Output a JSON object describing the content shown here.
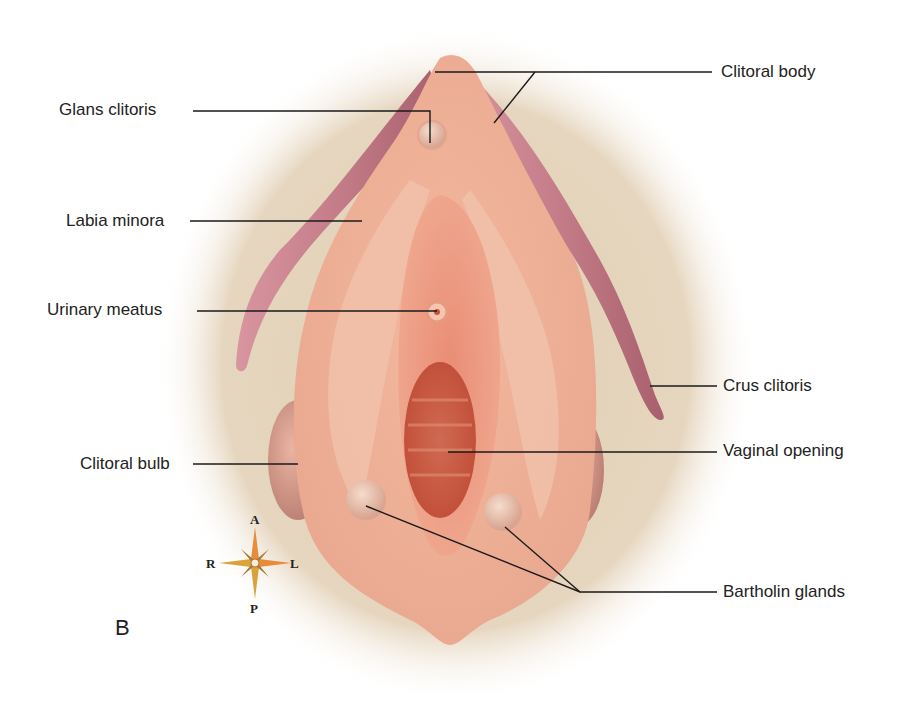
{
  "figure": {
    "panel_letter": "B",
    "colors": {
      "background": "#ffffff",
      "vignette": "#e3d2b8",
      "tissue_light": "#f2c0a8",
      "tissue_mid": "#e8a38a",
      "tissue_inner": "#e58870",
      "vaginal_opening": "#c9533c",
      "crus": "#c9808a",
      "leader_line": "#1a1a1a",
      "label_text": "#222222"
    }
  },
  "labels": {
    "left": [
      {
        "id": "glans-clitoris",
        "text": "Glans clitoris"
      },
      {
        "id": "labia-minora",
        "text": "Labia minora"
      },
      {
        "id": "urinary-meatus",
        "text": "Urinary meatus"
      },
      {
        "id": "clitoral-bulb",
        "text": "Clitoral bulb"
      }
    ],
    "right": [
      {
        "id": "clitoral-body",
        "text": "Clitoral body"
      },
      {
        "id": "crus-clitoris",
        "text": "Crus clitoris"
      },
      {
        "id": "vaginal-opening",
        "text": "Vaginal opening"
      },
      {
        "id": "bartholin-glands",
        "text": "Bartholin glands"
      }
    ]
  },
  "compass": {
    "top": "A",
    "bottom": "P",
    "left": "R",
    "right": "L"
  }
}
